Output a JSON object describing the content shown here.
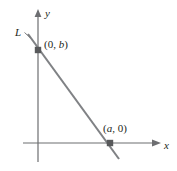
{
  "figure": {
    "type": "coordinate-plane-line-diagram",
    "colors": {
      "axis": "#6d6e71",
      "line": "#808285",
      "text": "#231f20",
      "point_marker": "#58595b",
      "background": "#ffffff"
    },
    "axes": {
      "x_label": "x",
      "y_label": "y",
      "origin": {
        "x": 38,
        "y": 143
      },
      "x_axis": {
        "start_x": 23,
        "end_x": 160,
        "y": 143,
        "arrow": "right"
      },
      "y_axis": {
        "x": 38,
        "start_y": 162,
        "end_y": 10,
        "arrow": "up"
      }
    },
    "line": {
      "name": "L",
      "start": {
        "x": 28,
        "y": 34
      },
      "end": {
        "x": 119,
        "y": 159
      }
    },
    "points": [
      {
        "name": "y-intercept",
        "label": "(0, b)",
        "label_prefix": "(0, ",
        "label_italic": "b",
        "label_suffix": ")",
        "marker": {
          "x": 38,
          "y": 50
        }
      },
      {
        "name": "x-intercept",
        "label": "(a, 0)",
        "label_prefix": "(",
        "label_italic": "a",
        "label_suffix": ", 0)",
        "marker": {
          "x": 110,
          "y": 143
        }
      }
    ],
    "leader_line": {
      "name": "L-pointer",
      "from": {
        "x": 24,
        "y": 33
      },
      "to": {
        "x": 30,
        "y": 38
      }
    }
  }
}
